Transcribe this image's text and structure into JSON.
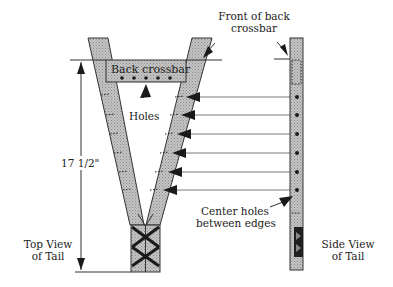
{
  "diagram": {
    "labels": {
      "back_crossbar": "Back crossbar",
      "holes": "Holes",
      "front_of_back_crossbar_line1": "Front of back",
      "front_of_back_crossbar_line2": "crossbar",
      "dimension": "17 1/2\"",
      "center_holes_line1": "Center holes",
      "center_holes_line2": "between edges",
      "top_view_line1": "Top View",
      "top_view_line2": "of Tail",
      "side_view_line1": "Side View",
      "side_view_line2": "of Tail"
    },
    "colors": {
      "strap_fill": "#bdbdbd",
      "outline": "#333333",
      "ink": "#222222",
      "background": "#ffffff"
    },
    "hole_count_crossbar": 5,
    "hole_count_side": 6,
    "arrow_count": 6
  }
}
